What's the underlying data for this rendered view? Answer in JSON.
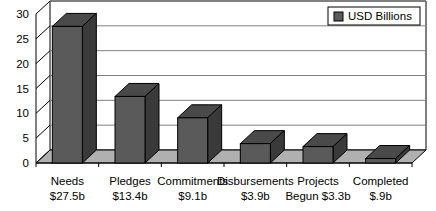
{
  "chart_data": {
    "type": "bar",
    "title": "",
    "subtitle": "",
    "xlabel": "",
    "ylabel": "",
    "categories": [
      "Needs",
      "Pledges",
      "Commitments",
      "Disbursements",
      "Projects Begun",
      "Completed"
    ],
    "category_lines": [
      [
        "Needs",
        "$27.5b"
      ],
      [
        "Pledges",
        "$13.4b"
      ],
      [
        "Commitments",
        "$9.1b"
      ],
      [
        "Disbursements",
        "$3.9b"
      ],
      [
        "Projects",
        "Begun $3.3b"
      ],
      [
        "Completed",
        "$.9b"
      ]
    ],
    "values": [
      27.5,
      13.4,
      9.1,
      3.9,
      3.3,
      0.9
    ],
    "value_labels": [
      "$27.5b",
      "$13.4b",
      "$9.1b",
      "$3.9b",
      "$3.3b",
      "$.9b"
    ],
    "ylim": [
      0,
      30
    ],
    "ytick_labels": [
      "0",
      "5",
      "10",
      "15",
      "20",
      "25",
      "30"
    ],
    "ytick_values": [
      0,
      5,
      10,
      15,
      20,
      25,
      30
    ],
    "grid": true,
    "grid_axis": "y",
    "legend": {
      "position": "top-right",
      "entries": [
        {
          "label": "USD Billions",
          "color": "#5a5a5a"
        }
      ]
    },
    "series": [
      {
        "name": "USD Billions",
        "values": [
          27.5,
          13.4,
          9.1,
          3.9,
          3.3,
          0.9
        ],
        "color": "#5a5a5a"
      }
    ],
    "style": {
      "three_d": true,
      "bar_front_color": "#5a5a5a",
      "bar_side_color": "#3a3a3a",
      "bar_top_color": "#4a4a4a",
      "floor_color": "#b0b0b0",
      "wall_color": "#ffffff",
      "grid_color": "#808080",
      "axis_color": "#000000"
    }
  }
}
